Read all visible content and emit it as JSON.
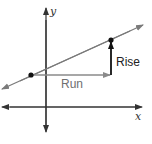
{
  "diagram": {
    "axes": {
      "x_label": "x",
      "y_label": "y"
    },
    "line": {
      "description": "Line with positive slope through two points",
      "color": "#7a7a7a"
    },
    "points": [
      {
        "name": "point-1",
        "px": [
          31,
          75
        ]
      },
      {
        "name": "point-2",
        "px": [
          111,
          40
        ]
      }
    ],
    "annotations": {
      "run_label": "Run",
      "rise_label": "Rise"
    },
    "colors": {
      "axis": "#333333",
      "line": "#7a7a7a",
      "run_arrow": "#8a8a8a",
      "rise_arrow": "#111111",
      "point": "#111111",
      "run_text": "#6f6f6f",
      "rise_text": "#222222"
    }
  }
}
